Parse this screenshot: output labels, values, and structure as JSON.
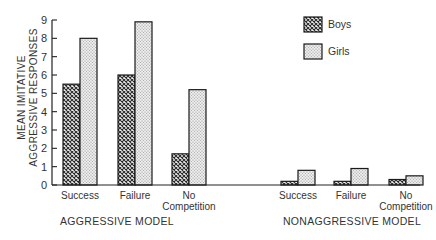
{
  "chart_data": {
    "type": "bar",
    "title": "",
    "ylabel": "MEAN IMITATIVE AGGRESSIVE RESPONSES",
    "ylabel_lines": [
      "MEAN IMITATIVE",
      "AGGRESSIVE RESPONSES"
    ],
    "ylim": [
      0,
      9
    ],
    "yticks": [
      "0",
      "1",
      "2",
      "3",
      "4",
      "5",
      "6",
      "7",
      "8",
      "9"
    ],
    "grid": false,
    "legend_position": "top-right",
    "groups": [
      {
        "label": "AGGRESSIVE MODEL",
        "categories": [
          {
            "label_lines": [
              "Success"
            ],
            "label": "Success"
          },
          {
            "label_lines": [
              "Failure"
            ],
            "label": "Failure"
          },
          {
            "label_lines": [
              "No",
              "Competition"
            ],
            "label": "No Competition"
          }
        ],
        "series": [
          {
            "name": "Boys",
            "values": [
              5.5,
              6.0,
              1.7
            ]
          },
          {
            "name": "Girls",
            "values": [
              8.0,
              8.9,
              5.2
            ]
          }
        ]
      },
      {
        "label": "NONAGGRESSIVE MODEL",
        "categories": [
          {
            "label_lines": [
              "Success"
            ],
            "label": "Success"
          },
          {
            "label_lines": [
              "Failure"
            ],
            "label": "Failure"
          },
          {
            "label_lines": [
              "No",
              "Competition"
            ],
            "label": "No Competition"
          }
        ],
        "series": [
          {
            "name": "Boys",
            "values": [
              0.2,
              0.2,
              0.3
            ]
          },
          {
            "name": "Girls",
            "values": [
              0.8,
              0.9,
              0.5
            ]
          }
        ]
      }
    ],
    "legend": [
      {
        "name": "Boys",
        "pattern": "crosshatch-dark"
      },
      {
        "name": "Girls",
        "pattern": "stipple-light"
      }
    ]
  },
  "colors": {
    "axis": "#222222",
    "boys_fill": "#555555",
    "girls_fill": "#d8d8d8",
    "outline": "#1a1a1a"
  }
}
